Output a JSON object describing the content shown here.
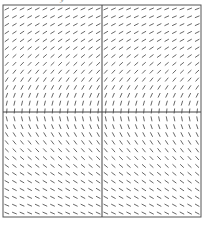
{
  "chart_data": {
    "type": "slope_field",
    "title": "",
    "xlabel": "",
    "ylabel": "y",
    "grid": false,
    "frame": {
      "left": 3,
      "top": 5,
      "right": 201,
      "bottom": 217
    },
    "axes_origin_px": {
      "x": 102,
      "y": 112
    },
    "columns": 26,
    "rows": 27,
    "segment_length_px": 5,
    "colors": {
      "segments": "#555555",
      "axes": "#444444",
      "frame": "#555555",
      "background": "#ffffff"
    }
  },
  "labels": {
    "y_axis": "y"
  }
}
